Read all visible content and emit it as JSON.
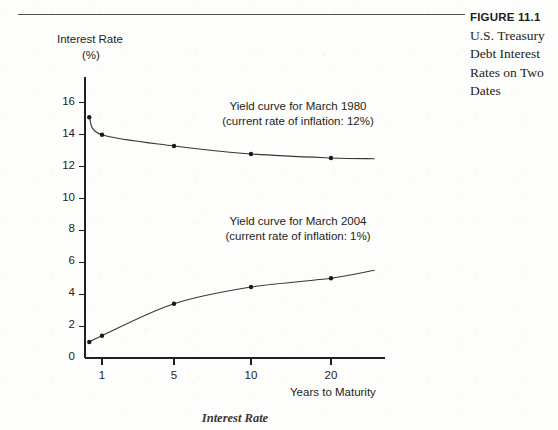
{
  "figure": {
    "label": "FIGURE 11.1",
    "title_lines": [
      "U.S. Treasury",
      "Debt Interest",
      "Rates on Two",
      "Dates"
    ]
  },
  "footer_note": "Interest Rate",
  "chart_data": {
    "type": "line",
    "title": "",
    "xlabel": "Years to Maturity",
    "ylabel_lines": [
      "Interest Rate",
      "(%)"
    ],
    "ylabel": "Interest Rate (%)",
    "xlim": [
      0,
      30
    ],
    "ylim": [
      0,
      17
    ],
    "grid": false,
    "legend": "annotations",
    "xticks": [
      1,
      5,
      10,
      20
    ],
    "xtick_labels": [
      "1",
      "5",
      "10",
      "20"
    ],
    "yticks": [
      0,
      2,
      4,
      6,
      8,
      10,
      12,
      14,
      16
    ],
    "ytick_labels": [
      "0",
      "2",
      "4",
      "6",
      "8",
      "10",
      "12",
      "14",
      "16"
    ],
    "series": [
      {
        "name": "Yield curve for March 1980",
        "annotation_lines": [
          "Yield curve for March 1980",
          "(current rate of inflation: 12%)"
        ],
        "inflation_rate": "12%",
        "color": "#3a3634",
        "x": [
          0.25,
          1,
          5,
          10,
          20,
          28
        ],
        "y": [
          15.1,
          14.0,
          13.3,
          12.8,
          12.55,
          12.5
        ],
        "marker_x": [
          0.25,
          1,
          5,
          10,
          20
        ],
        "marker_y": [
          15.1,
          14.0,
          13.3,
          12.8,
          12.55
        ]
      },
      {
        "name": "Yield curve for March 2004",
        "annotation_lines": [
          "Yield curve for March 2004",
          "(current rate of inflation: 1%)"
        ],
        "inflation_rate": "1%",
        "color": "#3a3634",
        "x": [
          0.25,
          1,
          5,
          10,
          20,
          28
        ],
        "y": [
          1.0,
          1.4,
          3.4,
          4.45,
          5.0,
          5.5
        ],
        "marker_x": [
          0.25,
          1,
          5,
          10,
          20
        ],
        "marker_y": [
          1.0,
          1.4,
          3.4,
          4.45,
          5.0
        ]
      }
    ]
  },
  "colors": {
    "ink": "#231f20",
    "rule": "#55504c",
    "curve": "#3a3634",
    "paper": "#fdfdfc"
  }
}
